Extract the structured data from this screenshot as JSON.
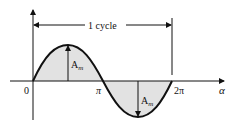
{
  "diagram": {
    "cycle_label": "1 cycle",
    "origin_label": "0",
    "pi_label": "π",
    "two_pi_label": "2π",
    "x_axis_label": "α",
    "amplitude_label": "A",
    "amplitude_subscript": "m",
    "colors": {
      "stroke": "#111111",
      "fill": "#e2e2e2",
      "background": "#ffffff"
    }
  }
}
